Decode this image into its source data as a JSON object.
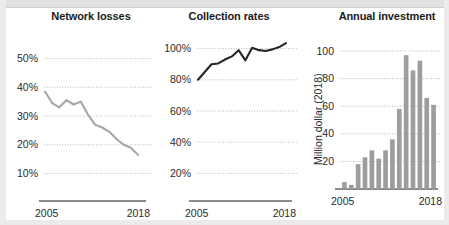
{
  "figure": {
    "background": "#ffffff",
    "accent_line_color": "#a6a6a6",
    "dark_line_color": "#262626",
    "bar_color": "#9d9d9d",
    "gridline_color": "#b9b9b9"
  },
  "charts": [
    {
      "title": "Network losses",
      "type": "line",
      "xlabel": "",
      "ylabel": "",
      "x_tick_left": "2005",
      "x_tick_right": "2018",
      "y_ticks": [
        "50%",
        "40%",
        "30%",
        "20%",
        "10%"
      ],
      "y_values": [
        50,
        40,
        30,
        20,
        10
      ],
      "ylim": [
        5,
        55
      ],
      "grid": true,
      "legend": "none",
      "series_color": "#a6a6a6",
      "x": [
        2005,
        2006,
        2007,
        2008,
        2009,
        2010,
        2011,
        2012,
        2013,
        2014,
        2015,
        2016,
        2017,
        2018
      ],
      "values": [
        38.5,
        34.5,
        33.0,
        35.5,
        34.0,
        35.0,
        30.5,
        27.0,
        26.0,
        24.5,
        22.0,
        20.0,
        19.0,
        16.5
      ]
    },
    {
      "title": "Collection rates",
      "type": "line",
      "xlabel": "",
      "ylabel": "",
      "x_tick_left": "2005",
      "x_tick_right": "2018",
      "y_ticks": [
        "100%",
        "80%",
        "60%",
        "40%",
        "20%"
      ],
      "y_values": [
        100,
        80,
        60,
        40,
        20
      ],
      "ylim": [
        10,
        110
      ],
      "grid": true,
      "legend": "none",
      "series_color": "#262626",
      "x": [
        2005,
        2006,
        2007,
        2008,
        2009,
        2010,
        2011,
        2012,
        2013,
        2014,
        2015,
        2016,
        2017,
        2018
      ],
      "values": [
        80.0,
        85.0,
        90.0,
        90.5,
        93.0,
        95.0,
        99.0,
        92.5,
        100.5,
        99.0,
        98.5,
        99.5,
        101.0,
        103.5
      ]
    },
    {
      "title": "Annual investment",
      "type": "bar",
      "xlabel": "",
      "ylabel": "Million dollar (2018)",
      "x_tick_left": "2005",
      "x_tick_right": "2018",
      "y_ticks": [
        "100",
        "80",
        "60",
        "40",
        "20"
      ],
      "y_values": [
        100,
        80,
        60,
        40,
        20
      ],
      "ylim": [
        0,
        108
      ],
      "grid": true,
      "legend": "none",
      "bar_color": "#9d9d9d",
      "categories": [
        2005,
        2006,
        2007,
        2008,
        2009,
        2010,
        2011,
        2012,
        2013,
        2014,
        2015,
        2016,
        2017,
        2018
      ],
      "values": [
        5,
        3,
        18,
        23,
        28,
        22,
        28,
        36,
        58,
        97,
        86,
        93,
        66,
        61
      ]
    }
  ]
}
